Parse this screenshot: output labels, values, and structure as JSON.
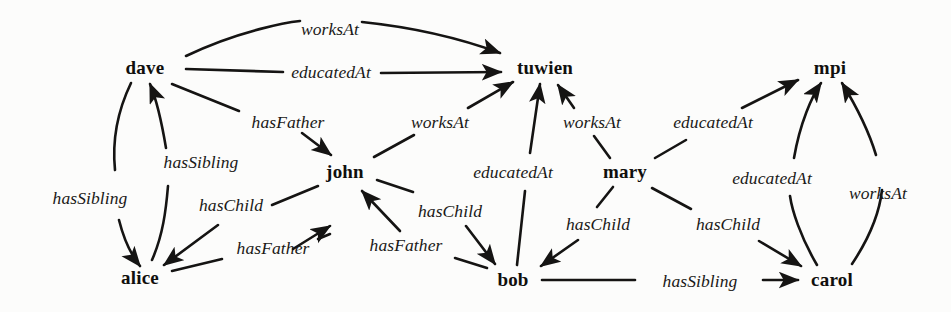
{
  "figure": {
    "kind": "knowledge-graph",
    "background_color": "#fcfcfb",
    "ink_color": "#151413",
    "width": 951,
    "height": 312
  },
  "nodes": [
    {
      "id": "dave",
      "label": "dave",
      "x": 145,
      "y": 68
    },
    {
      "id": "tuwien",
      "label": "tuwien",
      "x": 545,
      "y": 68
    },
    {
      "id": "mpi",
      "label": "mpi",
      "x": 830,
      "y": 68
    },
    {
      "id": "john",
      "label": "john",
      "x": 345,
      "y": 172
    },
    {
      "id": "mary",
      "label": "mary",
      "x": 625,
      "y": 172
    },
    {
      "id": "alice",
      "label": "alice",
      "x": 140,
      "y": 278
    },
    {
      "id": "bob",
      "label": "bob",
      "x": 513,
      "y": 280
    },
    {
      "id": "carol",
      "label": "carol",
      "x": 832,
      "y": 280
    }
  ],
  "edges": [
    {
      "from": "dave",
      "to": "tuwien",
      "label": "worksAt",
      "label_x": 330,
      "label_y": 29,
      "d": "M 186 56 C 240 30 290 22 300 21 M 362 22 C 420 28 470 42 500 53"
    },
    {
      "from": "dave",
      "to": "tuwien",
      "label": "educatedAt",
      "label_x": 331,
      "label_y": 72,
      "d": "M 186 69 L 283 72 M 381 73 L 501 72"
    },
    {
      "from": "dave",
      "to": "john",
      "label": "hasFather",
      "label_x": 288,
      "label_y": 122,
      "d": "M 172 84 L 239 111 M 302 133 L 331 155"
    },
    {
      "from": "dave",
      "to": "alice",
      "label": "hasSibling",
      "label_x": 90,
      "label_y": 198,
      "d": "M 131 83 C 118 110 112 140 115 170 M 119 220 C 124 240 132 256 140 266"
    },
    {
      "from": "alice",
      "to": "dave",
      "label": "hasSibling",
      "label_x": 201,
      "label_y": 162,
      "d": "M 152 260 C 163 235 166 210 168 186 M 166 148 C 161 118 155 96 150 84"
    },
    {
      "from": "john",
      "to": "alice",
      "label": "hasChild",
      "label_x": 231,
      "label_y": 205,
      "d": "M 318 186 L 272 205 M 218 225 L 164 265"
    },
    {
      "from": "alice",
      "to": "john",
      "label": "hasFather",
      "label_x": 273,
      "label_y": 248,
      "d": "M 172 271 L 222 259 M 318 239 L 330 234 M 293 249 L 330 226"
    },
    {
      "from": "john",
      "to": "tuwien",
      "label": "worksAt",
      "label_x": 440,
      "label_y": 122,
      "d": "M 374 157 L 414 135 M 468 108 L 513 82"
    },
    {
      "from": "john",
      "to": "bob",
      "label": "hasChild",
      "label_x": 450,
      "label_y": 211,
      "d": "M 377 180 L 413 192 M 466 226 L 495 264"
    },
    {
      "from": "bob",
      "to": "john",
      "label": "hasFather",
      "label_x": 406,
      "label_y": 245,
      "d": "M 487 268 L 455 258 M 400 231 L 362 191"
    },
    {
      "from": "bob",
      "to": "tuwien",
      "label": "educatedAt",
      "label_x": 513,
      "label_y": 172,
      "d": "M 517 265 L 525 191 M 530 153 L 540 84"
    },
    {
      "from": "mary",
      "to": "tuwien",
      "label": "worksAt",
      "label_x": 592,
      "label_y": 122,
      "d": "M 610 158 L 594 136 M 574 108 L 558 85"
    },
    {
      "from": "mary",
      "to": "mpi",
      "label": "educatedAt",
      "label_x": 713,
      "label_y": 122,
      "d": "M 655 158 L 686 140 M 742 108 L 798 80"
    },
    {
      "from": "mary",
      "to": "bob",
      "label": "hasChild",
      "label_x": 598,
      "label_y": 224,
      "d": "M 613 187 L 597 207 M 578 240 L 541 266"
    },
    {
      "from": "mary",
      "to": "carol",
      "label": "hasChild",
      "label_x": 728,
      "label_y": 224,
      "d": "M 652 188 L 691 209 M 759 241 L 801 266"
    },
    {
      "from": "bob",
      "to": "carol",
      "label": "hasSibling",
      "label_x": 700,
      "label_y": 281,
      "d": "M 542 280 L 635 280 M 763 280 L 798 280"
    },
    {
      "from": "carol",
      "to": "mpi",
      "label": "educatedAt",
      "label_x": 772,
      "label_y": 178,
      "d": "M 817 265 C 800 236 792 210 790 196 M 794 158 C 800 123 812 96 821 83"
    },
    {
      "from": "carol",
      "to": "mpi",
      "label": "worksAt",
      "label_x": 878,
      "label_y": 193,
      "d": "M 852 264 C 872 234 880 208 882 190 M 876 155 C 866 122 850 96 842 83"
    }
  ]
}
